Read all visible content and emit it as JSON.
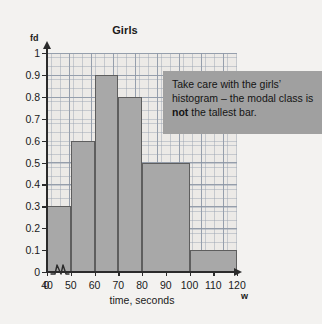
{
  "chart_data": {
    "type": "bar",
    "title": "Girls",
    "xlabel": "time, seconds",
    "ylabel": "fd",
    "x_axis_variable": "w",
    "grid": true,
    "legend": "none",
    "xlim": [
      40,
      120
    ],
    "ylim": [
      0,
      1
    ],
    "axis_break": true,
    "x_ticks": [
      "0",
      "40",
      "50",
      "60",
      "70",
      "80",
      "90",
      "100",
      "110",
      "120"
    ],
    "y_ticks": [
      "0",
      "0.1",
      "0.2",
      "0.3",
      "0.4",
      "0.5",
      "0.6",
      "0.7",
      "0.8",
      "0.9",
      "1"
    ],
    "bins": [
      {
        "label": "40-50",
        "start": 40,
        "end": 50,
        "fd": 0.3
      },
      {
        "label": "50-60",
        "start": 50,
        "end": 60,
        "fd": 0.6
      },
      {
        "label": "60-70",
        "start": 60,
        "end": 70,
        "fd": 0.9
      },
      {
        "label": "70-80",
        "start": 70,
        "end": 80,
        "fd": 0.8
      },
      {
        "label": "80-100",
        "start": 80,
        "end": 100,
        "fd": 0.5
      },
      {
        "label": "100-120",
        "start": 100,
        "end": 120,
        "fd": 0.1
      }
    ],
    "colors": {
      "bar_fill": "#a8a8a8",
      "bar_edge": "#5e5e5e",
      "grid": "#78849 6",
      "plot_background": "#eceae7",
      "page_background": "#f3f2f0",
      "axis": "#2b2b2b",
      "callout_background": "#a0a0a0",
      "text": "#141414"
    }
  },
  "callout": {
    "text_before": "Take care with the girls’ histogram – the modal class is ",
    "emphasis": "not",
    "text_after": " the tallest bar."
  }
}
